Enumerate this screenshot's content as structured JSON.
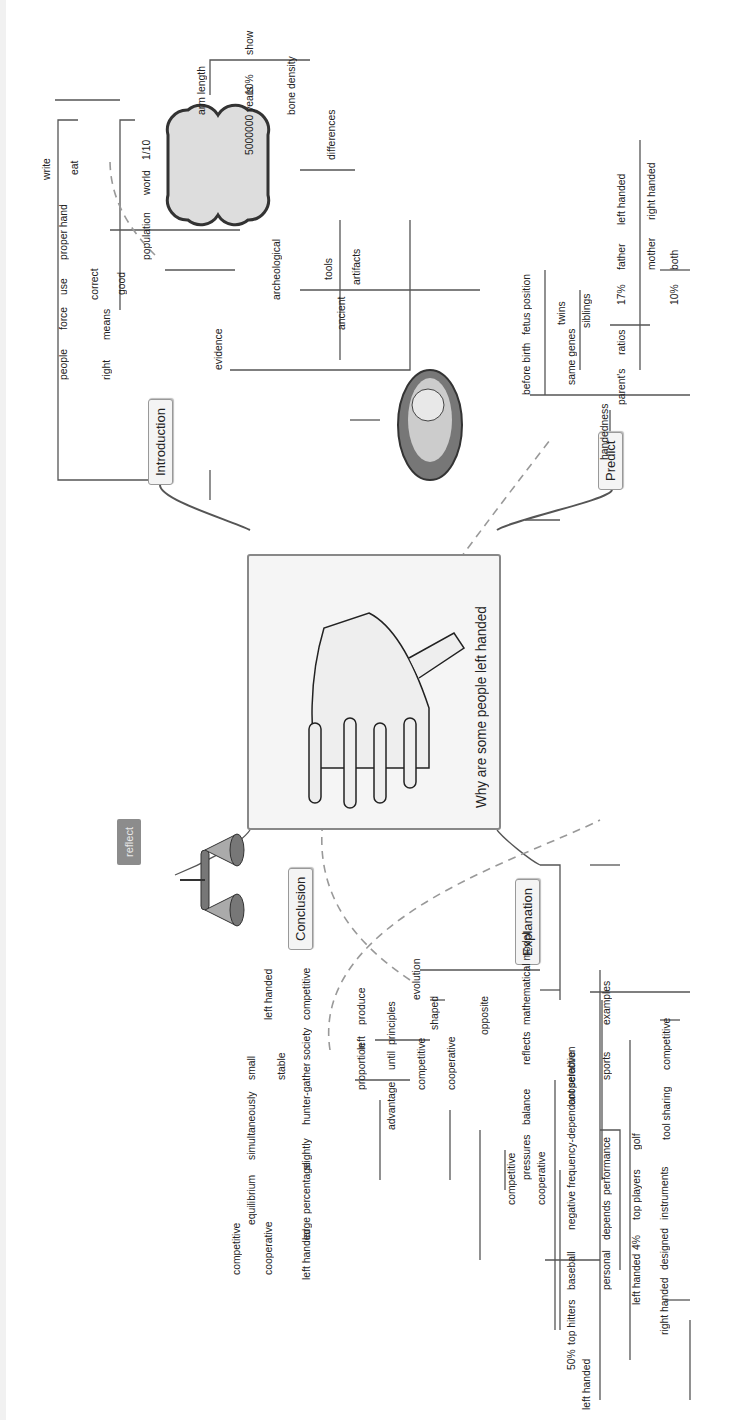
{
  "map": {
    "central_topic": "Why are some people left handed",
    "central_image": "hand-icon",
    "branches": {
      "introduction": {
        "label": "Introduction",
        "row1": [
          "people",
          "force",
          "use",
          "proper hand"
        ],
        "row1_sub": [
          "write",
          "eat"
        ],
        "row2": [
          "right",
          "means"
        ],
        "row2_sub": [
          "correct",
          "good"
        ],
        "evidence": "evidence",
        "population_row": [
          "population",
          "world",
          "1/10"
        ],
        "archeological": "archeological",
        "years_row": [
          "5000000 years",
          "10%",
          "show",
          "differences"
        ],
        "differences_sub": [
          "arm length",
          "bone density"
        ],
        "ancient_row": [
          "ancient"
        ],
        "ancient_sub": [
          "tools",
          "artifacts"
        ]
      },
      "predict": {
        "label": "Predict",
        "handedness": "handedness",
        "row1": [
          "before birth",
          "fetus position"
        ],
        "row2": [
          "same genes"
        ],
        "row2_sub": [
          "twins",
          "siblings"
        ],
        "row3": [
          "parent's",
          "ratios"
        ],
        "ratios_sub_a": [
          "17%"
        ],
        "ratios_sub_a_children": [
          "father",
          "left handed",
          "mother",
          "right handed"
        ],
        "ratios_sub_b": [
          "10%",
          "both"
        ]
      },
      "conclusion": {
        "label": "Conclusion",
        "left_handed": "left handed",
        "left_handed_sub": [
          "small",
          "stable"
        ],
        "reflect": "reflect",
        "reflect_row": [
          "equilibrium",
          "simultaneously"
        ],
        "reflect_sub": [
          "competitive",
          "cooperative"
        ],
        "competitive_row": [
          "competitive",
          "hunter-gather society",
          "slightly",
          "large percentage",
          "left handed"
        ]
      },
      "explanation": {
        "label": "Explanation",
        "evolution": "evolution",
        "evolution_rows": [
          [
            "proportion",
            "left",
            "produce"
          ],
          [
            "advantage",
            "until",
            "principles"
          ],
          [
            "competitive",
            "shaped"
          ],
          [
            "cooperative"
          ],
          [
            "opposite"
          ]
        ],
        "math_row": [
          "mathematical model",
          "reflects",
          "balance",
          "pressures"
        ],
        "pressures_sub": [
          "competitive",
          "cooperative"
        ],
        "nfds_row": [
          "cooperative",
          "negative frequency-dependant selection",
          "baseball",
          "top hitters",
          "50%",
          "left handed",
          "against",
          "right handed"
        ],
        "examples_row": [
          "examples",
          "sports"
        ],
        "sports_sub_row1": [
          "performance",
          "depends",
          "personal"
        ],
        "sports_sub_row2": [
          "golf",
          "top players",
          "4%",
          "left handed"
        ],
        "sports_sub_row3": [
          "instruments",
          "designed",
          "right handed"
        ],
        "sports_sub_row4": [
          "competitive",
          "tool sharing"
        ]
      }
    },
    "images": [
      "bone-icon",
      "fetus-icon",
      "scales-icon"
    ],
    "colors": {
      "line": "#555555",
      "dashed": "#999999",
      "topic_bg": "#f4f4f4",
      "reflect_bg": "#8c8c8c"
    }
  }
}
